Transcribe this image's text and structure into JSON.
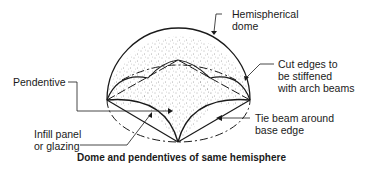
{
  "diagram": {
    "caption": "Dome and pendentives of same hemisphere",
    "labels": {
      "hemispherical_dome": "Hemispherical\ndome",
      "pendentive": "Pendentive",
      "cut_edges": "Cut edges to\nbe stiffened\nwith arch beams",
      "infill_panel": "Infill panel\nor glazing",
      "tie_beam": "Tie beam around\nbase edge"
    },
    "colors": {
      "line": "#1a1a1a",
      "stipple": "#555555",
      "background": "#ffffff"
    }
  }
}
